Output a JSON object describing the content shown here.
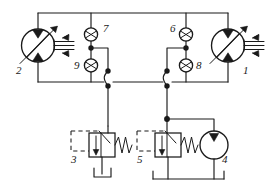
{
  "diagram": {
    "type": "hydraulic-schematic",
    "background_color": "#ffffff",
    "line_color": "#1a1a1a",
    "labels": {
      "pump_right": "1",
      "pump_left": "2",
      "relief_valve_left": "3",
      "charge_pump": "4",
      "relief_valve_right": "5",
      "check_valve_top_right": "6",
      "check_valve_top_left": "7",
      "check_valve_bottom_right": "8",
      "check_valve_bottom_left": "9"
    },
    "components": [
      {
        "id": "1",
        "name": "variable-displacement-hydraulic-motor",
        "symbol": "circle-with-two-solid-triangles-and-diagonal-arrow"
      },
      {
        "id": "2",
        "name": "variable-displacement-hydraulic-pump",
        "symbol": "circle-with-two-solid-triangles-and-diagonal-arrow"
      },
      {
        "id": "3",
        "name": "pilot-operated-pressure-relief-valve",
        "symbol": "square-body-with-spring-and-dashed-pilot-line"
      },
      {
        "id": "4",
        "name": "fixed-displacement-charge-pump",
        "symbol": "circle-with-single-solid-triangle"
      },
      {
        "id": "5",
        "name": "pilot-operated-pressure-relief-valve",
        "symbol": "square-body-with-spring-and-dashed-pilot-line"
      },
      {
        "id": "6",
        "name": "check-valve",
        "symbol": "circle-with-seat"
      },
      {
        "id": "7",
        "name": "check-valve",
        "symbol": "circle-with-seat"
      },
      {
        "id": "8",
        "name": "check-valve",
        "symbol": "circle-with-seat"
      },
      {
        "id": "9",
        "name": "check-valve",
        "symbol": "circle-with-seat"
      }
    ]
  }
}
